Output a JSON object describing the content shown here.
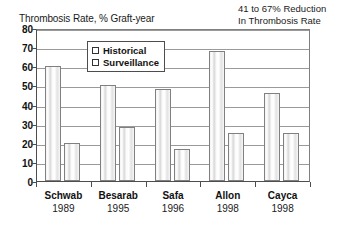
{
  "chart_data": {
    "type": "bar",
    "title": "Thrombosis Rate, % Graft-year",
    "xlabel": "",
    "ylabel": "Thrombosis Rate, % Graft-year",
    "ylim": [
      0,
      80
    ],
    "yticks": [
      0,
      10,
      20,
      30,
      40,
      50,
      60,
      70,
      80
    ],
    "grid": true,
    "legend_position": "inside-top-center",
    "categories": [
      "Schwab",
      "Besarab",
      "Safa",
      "Allon",
      "Cayca"
    ],
    "category_years": [
      "1989",
      "1995",
      "1996",
      "1998",
      "1998"
    ],
    "series": [
      {
        "name": "Historical",
        "values": [
          60,
          50,
          48,
          68,
          46
        ]
      },
      {
        "name": "Surveillance",
        "values": [
          20,
          28,
          17,
          25,
          25
        ]
      }
    ],
    "annotations": [
      {
        "text_line1": "41 to 67% Reduction",
        "text_line2": "In Thrombosis Rate"
      }
    ]
  },
  "axis_title": "Thrombosis Rate, % Graft-year",
  "annotation": {
    "line1": "41 to 67% Reduction",
    "line2": "In Thrombosis Rate"
  },
  "legend": {
    "items": [
      {
        "label": "Historical"
      },
      {
        "label": "Surveillance"
      }
    ]
  },
  "yaxis": {
    "ticks": [
      "80",
      "70",
      "60",
      "50",
      "40",
      "30",
      "20",
      "10",
      "0"
    ]
  },
  "xaxis": {
    "groups": [
      {
        "name": "Schwab",
        "year": "1989"
      },
      {
        "name": "Besarab",
        "year": "1995"
      },
      {
        "name": "Safa",
        "year": "1996"
      },
      {
        "name": "Allon",
        "year": "1998"
      },
      {
        "name": "Cayca",
        "year": "1998"
      }
    ]
  }
}
